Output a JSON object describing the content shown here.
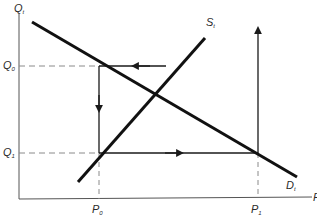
{
  "diagram": {
    "type": "supply-demand cobweb diagram",
    "colors": {
      "line": "#1a1a1a",
      "dashed": "#8a8a8a",
      "text": "#2a2a2a",
      "background": "#ffffff"
    },
    "axes": {
      "y_label": {
        "main": "Q",
        "sub": "t"
      },
      "x_label": {
        "main": "P",
        "sub": ""
      }
    },
    "curves": {
      "supply": {
        "main": "S",
        "sub": "t"
      },
      "demand": {
        "main": "D",
        "sub": "t"
      }
    },
    "levels": {
      "q0": {
        "main": "Q",
        "sub": "0"
      },
      "q1": {
        "main": "Q",
        "sub": "1"
      },
      "p0": {
        "main": "P",
        "sub": "0"
      },
      "p1": {
        "main": "P",
        "sub": "1"
      }
    },
    "arrows": [
      {
        "name": "q0-leftward",
        "direction": "left"
      },
      {
        "name": "p0-downward",
        "direction": "down"
      },
      {
        "name": "q1-rightward",
        "direction": "right"
      },
      {
        "name": "p1-upward",
        "direction": "up"
      }
    ]
  }
}
